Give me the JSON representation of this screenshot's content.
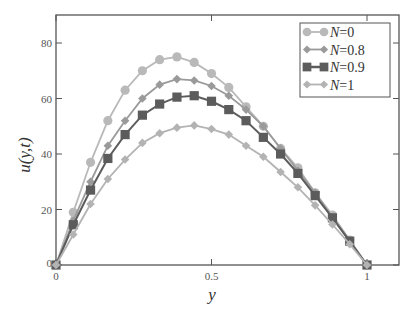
{
  "chart_data": {
    "type": "line",
    "title": "",
    "xlabel": "y",
    "ylabel": "u(y,t)",
    "xlim": [
      0,
      1.1
    ],
    "ylim": [
      0,
      90
    ],
    "xticks": [
      0,
      0.5,
      1
    ],
    "xtick_labels": [
      "0",
      "0.5",
      "1"
    ],
    "yticks": [
      0,
      20,
      40,
      60,
      80
    ],
    "ytick_labels": [
      "0",
      "20",
      "40",
      "60",
      "80"
    ],
    "grid": false,
    "legend_position": "upper right",
    "x": [
      0,
      0.0556,
      0.1111,
      0.1667,
      0.2222,
      0.2778,
      0.3333,
      0.3889,
      0.4444,
      0.5,
      0.5556,
      0.6111,
      0.6667,
      0.7222,
      0.7778,
      0.8333,
      0.8889,
      0.9444,
      1.0
    ],
    "series": [
      {
        "name": "N=0",
        "label_var": "N",
        "label_val": "=0",
        "marker": "circle",
        "color": "#b9b9b9",
        "values": [
          0,
          19,
          37,
          52,
          63,
          70,
          74,
          75,
          73,
          69,
          64,
          57,
          50,
          42,
          35,
          26,
          18,
          9,
          0
        ]
      },
      {
        "name": "N=0.8",
        "label_var": "N",
        "label_val": "=0.8",
        "marker": "diamond",
        "color": "#9a9a9a",
        "values": [
          0,
          16,
          30,
          43,
          52,
          60,
          65,
          67,
          66.5,
          64.5,
          61,
          56,
          50,
          42,
          34,
          26,
          17,
          8.5,
          0
        ]
      },
      {
        "name": "N=0.9",
        "label_var": "N",
        "label_val": "=0.9",
        "marker": "square",
        "color": "#5c5c5c",
        "values": [
          0,
          14.5,
          27,
          38.4,
          47,
          54,
          58,
          60.5,
          61,
          59,
          56,
          52,
          46,
          40,
          33,
          25,
          17,
          8.6,
          0
        ]
      },
      {
        "name": "N=1",
        "label_var": "N",
        "label_val": "=1",
        "marker": "diamond",
        "color": "#b3b3b3",
        "values": [
          0,
          11,
          22,
          31,
          38,
          44,
          47.5,
          49.5,
          50.3,
          49,
          47,
          43,
          39,
          33.5,
          28,
          21.5,
          14.6,
          7.5,
          0
        ]
      }
    ]
  },
  "labels": {
    "xlabel": "y",
    "ylabel": "u(y,t)"
  }
}
